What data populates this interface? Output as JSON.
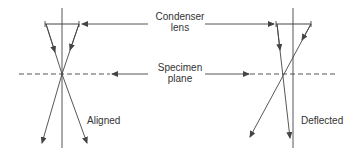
{
  "diagram": {
    "labels": {
      "condenser_line1": "Condenser",
      "condenser_line2": "lens",
      "specimen_line1": "Specimen",
      "specimen_line2": "plane",
      "aligned": "Aligned",
      "deflected": "Deflected"
    },
    "colors": {
      "line": "#444444",
      "background": "#ffffff"
    }
  }
}
